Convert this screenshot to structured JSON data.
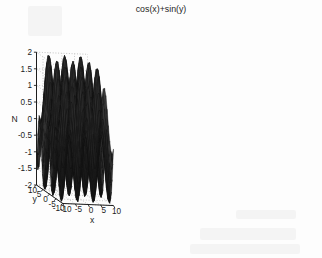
{
  "figure": {
    "title": "cos(x)+sin(y)",
    "background_color": "#fdfdfd",
    "surface_color": "#2a2a2a",
    "mesh_color": "#111111",
    "grid_color": "#9a9a9a",
    "axis_color": "#1d1d1d"
  },
  "axes": {
    "x": {
      "label": "x",
      "ticks": [
        "-10",
        "-5",
        "0",
        "5",
        "10"
      ],
      "tick_values": [
        -10,
        -5,
        0,
        5,
        10
      ],
      "range": [
        -10,
        10
      ]
    },
    "y": {
      "label": "y",
      "ticks": [
        "10",
        "5",
        "0",
        "-5",
        "-10"
      ],
      "tick_values": [
        10,
        5,
        0,
        -5,
        -10
      ],
      "range": [
        -10,
        10
      ]
    },
    "z": {
      "label": "N",
      "ticks": [
        "2",
        "1.5",
        "1",
        "0.5",
        "0",
        "-0.5",
        "-1",
        "-1.5",
        "-2"
      ],
      "tick_values": [
        2,
        1.5,
        1,
        0.5,
        0,
        -0.5,
        -1,
        -1.5,
        -2
      ],
      "range": [
        -2,
        2
      ]
    }
  },
  "chart_data": {
    "type": "surface",
    "title": "cos(x)+sin(y)",
    "xlabel": "x",
    "ylabel": "y",
    "zlabel": "N",
    "xlim": [
      -10,
      10
    ],
    "ylim": [
      -10,
      10
    ],
    "zlim": [
      -2,
      2
    ],
    "grid": true,
    "legend": null,
    "function": "cos(x)+sin(y)",
    "x_ticks": [
      -10,
      -5,
      0,
      5,
      10
    ],
    "y_ticks": [
      -10,
      -5,
      0,
      5,
      10
    ],
    "z_ticks": [
      -2,
      -1.5,
      -1,
      -0.5,
      0,
      0.5,
      1,
      1.5,
      2
    ],
    "samples": 41,
    "view": {
      "azimuth": -37.5,
      "elevation": 30
    },
    "shading": "mesh-dark",
    "z_min_observed": -2,
    "z_max_observed": 2
  }
}
